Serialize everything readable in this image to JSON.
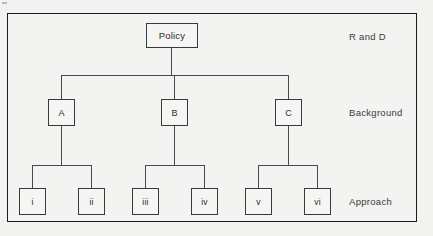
{
  "diagram": {
    "border_color": "#1d1d1d",
    "line_color": "#4a4a4a",
    "background_color": "#f2f2f0",
    "root": {
      "label": "Policy"
    },
    "level2": [
      {
        "label": "A"
      },
      {
        "label": "B"
      },
      {
        "label": "C"
      }
    ],
    "level3": [
      {
        "label": "i"
      },
      {
        "label": "ii"
      },
      {
        "label": "iii"
      },
      {
        "label": "iv"
      },
      {
        "label": "v"
      },
      {
        "label": "vi"
      }
    ],
    "tier_labels": [
      {
        "label": "R and D"
      },
      {
        "label": "Background"
      },
      {
        "label": "Approach"
      }
    ]
  }
}
